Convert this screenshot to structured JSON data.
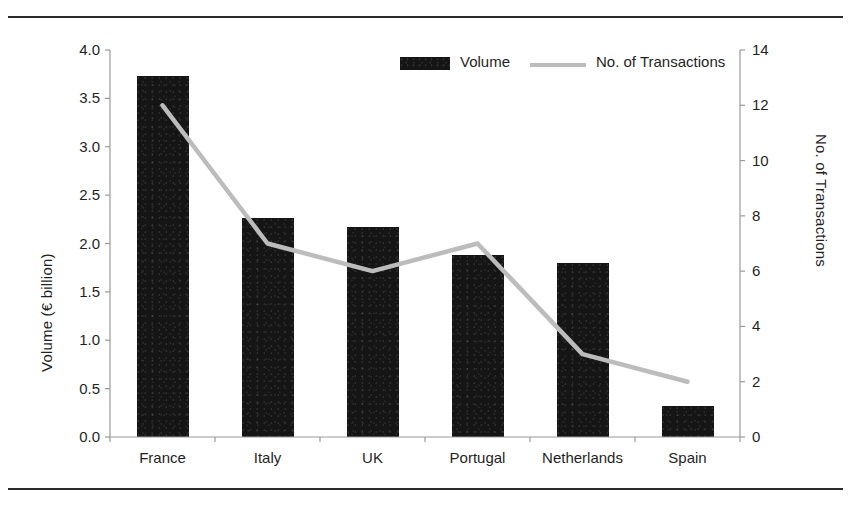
{
  "chart_data": {
    "type": "bar",
    "title": "",
    "subtitle": "",
    "categories": [
      "France",
      "Italy",
      "UK",
      "Portugal",
      "Netherlands",
      "Spain"
    ],
    "xlabel": "",
    "ylabel": "Volume (€ billion)",
    "y2label": "No. of Transactions",
    "ylim": [
      0,
      4
    ],
    "y2lim": [
      0,
      14
    ],
    "ytick_labels": [
      "0.0",
      "0.5",
      "1.0",
      "1.5",
      "2.0",
      "2.5",
      "3.0",
      "3.5",
      "4.0"
    ],
    "ytick_values": [
      0,
      0.5,
      1,
      1.5,
      2,
      2.5,
      3,
      3.5,
      4
    ],
    "y2tick_labels": [
      "0",
      "2",
      "4",
      "6",
      "8",
      "10",
      "12",
      "14"
    ],
    "y2tick_values": [
      0,
      2,
      4,
      6,
      8,
      10,
      12,
      14
    ],
    "grid": false,
    "legend_position": "top-center",
    "series": [
      {
        "name": "Volume",
        "kind": "bar",
        "axis": "left",
        "color": "#151515",
        "values": [
          3.73,
          2.26,
          2.17,
          1.88,
          1.8,
          0.32
        ]
      },
      {
        "name": "No. of Transactions",
        "kind": "line",
        "axis": "right",
        "color": "#bcbcbc",
        "values": [
          12,
          7,
          6,
          7,
          3,
          2
        ]
      }
    ]
  },
  "legend": {
    "items": [
      {
        "label": "Volume",
        "marker": "bar-swatch",
        "color": "#151515"
      },
      {
        "label": "No. of Transactions",
        "marker": "line-swatch",
        "color": "#bcbcbc"
      }
    ]
  },
  "axes": {
    "left_title": "Volume (€ billion)",
    "right_title": "No. of Transactions"
  },
  "frame": {
    "top_rule": "",
    "bottom_rule": ""
  }
}
